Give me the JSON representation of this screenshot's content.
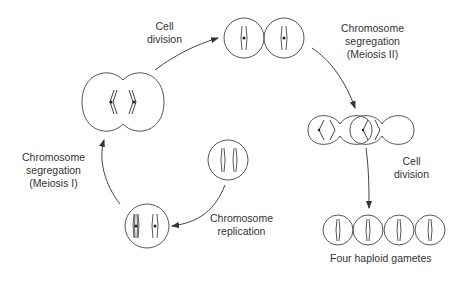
{
  "diagram": {
    "labels": {
      "cell_division_top": [
        "Cell",
        "division"
      ],
      "meiosis_ii": [
        "Chromosome",
        "segregation",
        "(Meiosis II)"
      ],
      "cell_division_right": [
        "Cell",
        "division"
      ],
      "gametes": "Four haploid gametes",
      "replication": [
        "Chromosome",
        "replication"
      ],
      "meiosis_i": [
        "Chromosome",
        "segregation",
        "(Meiosis I)"
      ]
    },
    "stages": [
      {
        "id": "diploid-cell",
        "description": "Single cell with two unreplicated chromosomes"
      },
      {
        "id": "replicated-cell",
        "description": "Cell with two replicated chromosomes"
      },
      {
        "id": "meiosis-i-cell",
        "description": "Dividing cell with paired chromosomes separating"
      },
      {
        "id": "two-cells",
        "description": "Two cells each with one replicated chromosome"
      },
      {
        "id": "meiosis-ii-cells",
        "description": "Two dividing cells with chromatids separating"
      },
      {
        "id": "four-gametes",
        "description": "Four haploid gametes each with one chromosome"
      }
    ],
    "colors": {
      "line": "#555555",
      "chromosome": "#444444",
      "background": "#ffffff"
    }
  }
}
